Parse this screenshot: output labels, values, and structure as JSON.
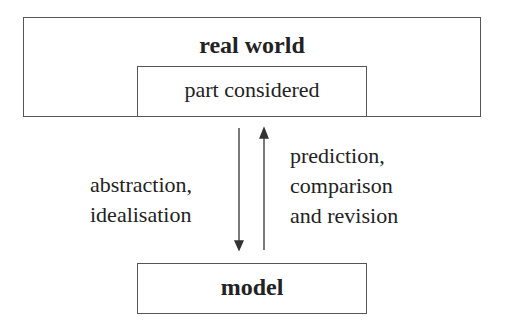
{
  "diagram": {
    "outer_box": {
      "label": "real world"
    },
    "inner_box": {
      "label": "part considered"
    },
    "model_box": {
      "label": "model"
    },
    "down_arrow": {
      "label_lines": [
        "abstraction,",
        "idealisation"
      ]
    },
    "up_arrow": {
      "label_lines": [
        "prediction,",
        "comparison",
        "and revision"
      ]
    },
    "colors": {
      "line": "#555555",
      "text": "#222222",
      "background": "#ffffff"
    }
  }
}
